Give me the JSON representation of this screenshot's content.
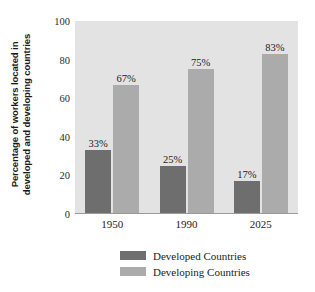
{
  "chart_data": {
    "type": "bar",
    "title": "",
    "subtitle": "",
    "xlabel": "",
    "ylabel_line1": "Percentage of workers located in",
    "ylabel_line2": "developed and developing countries",
    "categories": [
      "1950",
      "1990",
      "2025"
    ],
    "series": [
      {
        "name": "Developed Countries",
        "color": "#6e6e6e",
        "values": [
          33,
          25,
          17
        ],
        "value_labels": [
          "33%",
          "25%",
          "17%"
        ]
      },
      {
        "name": "Developing Countries",
        "color": "#ababab",
        "values": [
          67,
          75,
          83
        ],
        "value_labels": [
          "67%",
          "75%",
          "83%"
        ]
      }
    ],
    "ylim": [
      0,
      100
    ],
    "yticks": [
      0,
      20,
      40,
      60,
      80,
      100
    ],
    "ytick_labels": [
      "0",
      "20",
      "40",
      "60",
      "80",
      "100"
    ],
    "grid": false,
    "legend_position": "bottom",
    "plot_background": "#e3e3e3",
    "figure_background": "#ffffff"
  }
}
